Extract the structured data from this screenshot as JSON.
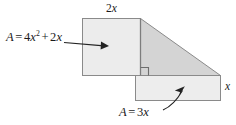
{
  "figure": {
    "type": "geometry-diagram",
    "labels": {
      "top_width": {
        "coefficient": "2",
        "variable": "x",
        "text": "2x"
      },
      "right_height": {
        "coefficient": "",
        "variable": "x",
        "text": "x"
      },
      "left_area": {
        "name": "A",
        "equals": "=",
        "term1_coefficient": "4",
        "term1_variable": "x",
        "term1_exponent": "2",
        "operator": "+",
        "term2_coefficient": "2",
        "term2_variable": "x",
        "text": "A = 4x2 + 2x"
      },
      "bottom_area": {
        "name": "A",
        "equals": "=",
        "coefficient": "3",
        "variable": "x",
        "text": "A = 3x"
      }
    },
    "shapes": {
      "left_rectangle": {
        "fill": "#ececec",
        "stroke": "#8a8a8a",
        "x": 82,
        "y": 18,
        "width": 58,
        "height": 57
      },
      "triangle": {
        "fill": "#d4d4d4",
        "stroke": "#8a8a8a",
        "points": "140,18 220,75 140,75"
      },
      "bottom_rectangle": {
        "fill": "#ededed",
        "stroke": "#8a8a8a",
        "x": 135,
        "y": 75,
        "width": 85,
        "height": 25
      },
      "right_angle_marker": {
        "stroke": "#6d6d6d",
        "x": 140,
        "y": 75,
        "size": 8
      }
    },
    "annotations": {
      "left_arrow": {
        "type": "straight-arrow",
        "from_x": 64,
        "from_y": 42,
        "to_x": 106,
        "to_y": 46
      },
      "bottom_arrow": {
        "type": "curved-arrow",
        "from_x": 163,
        "from_y": 110,
        "to_x": 184,
        "to_y": 87
      }
    },
    "colors": {
      "background": "#ffffff",
      "outline": "#8a8a8a",
      "text": "#1a1a1a",
      "arrow": "#222222",
      "triangle_fill": "#d4d4d4",
      "rectangle_fill": "#ececec"
    }
  }
}
